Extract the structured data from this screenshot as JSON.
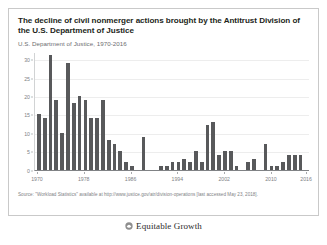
{
  "figure": {
    "title": "The decline of civil nonmerger actions brought by the Antitrust Division of the U.S. Department of Justice",
    "subtitle": "U.S. Department of Justice, 1970-2016",
    "source_note": "Source: \"Workload Statistics\" available at http://www.justice.gov/atr/division-operations [last accessed May 23, 2018].",
    "logo_text": "Equitable Growth",
    "logo_icon": "equitable-growth-circle-icon",
    "border_color": "#c9c9c9",
    "background_color": "#ffffff"
  },
  "chart_data": {
    "type": "bar",
    "title": "The decline of civil nonmerger actions brought by the Antitrust Division of the U.S. Department of Justice",
    "subtitle": "U.S. Department of Justice, 1970-2016",
    "xlabel": "",
    "ylabel": "",
    "ylim": [
      0,
      32
    ],
    "yticks": [
      0,
      5,
      10,
      15,
      20,
      25,
      30
    ],
    "ytick_labels": [
      "0",
      "5",
      "10",
      "15",
      "20",
      "25",
      "30"
    ],
    "xtick_labels": [
      "1970",
      "1978",
      "1986",
      "1994",
      "2002",
      "2010",
      "2016"
    ],
    "xtick_years": [
      1970,
      1978,
      1986,
      1994,
      2002,
      2010,
      2016
    ],
    "grid": true,
    "legend": "none",
    "bar_color": "#58595b",
    "gridline_color": "#ededed",
    "categories": [
      1970,
      1971,
      1972,
      1973,
      1974,
      1975,
      1976,
      1977,
      1978,
      1979,
      1980,
      1981,
      1982,
      1983,
      1984,
      1985,
      1986,
      1987,
      1988,
      1989,
      1990,
      1991,
      1992,
      1993,
      1994,
      1995,
      1996,
      1997,
      1998,
      1999,
      2000,
      2001,
      2002,
      2003,
      2004,
      2005,
      2006,
      2007,
      2008,
      2009,
      2010,
      2011,
      2012,
      2013,
      2014,
      2015,
      2016
    ],
    "values": [
      15,
      14,
      31,
      19,
      10,
      29,
      18,
      20,
      19,
      14,
      14,
      19,
      8,
      7,
      5,
      2,
      1,
      0,
      9,
      0,
      0,
      1,
      1,
      2,
      2,
      3,
      2,
      5,
      2,
      12,
      13,
      4,
      5,
      5,
      1,
      0,
      2,
      3,
      0,
      7,
      1,
      1,
      2,
      4,
      4,
      4,
      0
    ]
  }
}
